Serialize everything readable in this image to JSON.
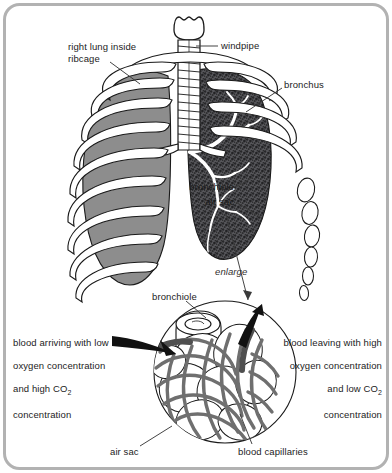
{
  "figure": {
    "title_visible": false,
    "border_color": "#b2b2b2",
    "background": "#ffffff"
  },
  "colors": {
    "right_lung_fill": "#8d8d8d",
    "left_lung_stipple": "#4a4a4a",
    "capillary_gray": "#757575",
    "outline": "#1a1a1a",
    "text": "#1c1c1c",
    "border": "#b2b2b2"
  },
  "labels": {
    "right_lung": "right lung inside\nribcage",
    "windpipe": "windpipe",
    "bronchus": "bronchus",
    "bronchiole_upper": "bronchiole",
    "air_sac_upper": "air sac",
    "enlarge": "enlarge",
    "bronchiole_lower": "bronchiole",
    "air_sac_lower": "air sac",
    "blood_capillaries": "blood capillaries"
  },
  "annotations": {
    "left_callout": {
      "line1": "blood arriving with low",
      "line2": "oxygen concentration",
      "line3_pre": "and high CO",
      "line3_sub": "2",
      "line4": "concentration",
      "align": "left"
    },
    "right_callout": {
      "line1": "blood leaving with high",
      "line2": "oxygen concentration",
      "line3_pre": "and low CO",
      "line3_sub": "2",
      "line4": "concentration",
      "align": "right"
    }
  },
  "icons": {
    "leader_line": "leader-line-icon",
    "arrow_in": "blood-inflow-arrow-icon",
    "arrow_out": "blood-outflow-arrow-icon",
    "enlarge_pointer": "enlarge-pointer-icon"
  }
}
